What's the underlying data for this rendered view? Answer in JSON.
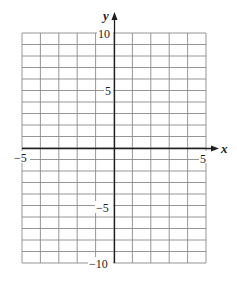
{
  "chart_data": {
    "type": "scatter",
    "title": "",
    "xlabel": "x",
    "ylabel": "y",
    "xlim": [
      -5,
      5
    ],
    "ylim": [
      -10,
      10
    ],
    "grid": true,
    "grid_step_x": 1,
    "grid_step_y": 2,
    "series": [],
    "x_tick_labels": [
      "−5",
      "5"
    ],
    "y_tick_labels": [
      "10",
      "5",
      "−5",
      "−10"
    ],
    "axis_arrows": [
      "positive-x",
      "positive-y"
    ]
  },
  "labels": {
    "x_axis": "x",
    "y_axis": "y",
    "x_min": "−5",
    "x_max": "5",
    "y_max": "10",
    "y_mid_pos": "5",
    "y_mid_neg": "−5",
    "y_min": "−10"
  },
  "colors": {
    "grid": "#8a8a8a",
    "axis": "#1e1e1e",
    "text": "#222222"
  }
}
